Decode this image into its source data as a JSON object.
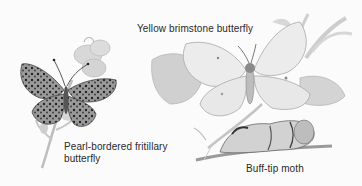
{
  "labels": {
    "brimstone": "Yellow brimstone butterfly",
    "fritillary_line1": "Pearl-bordered fritillary",
    "fritillary_line2": "butterfly",
    "moth": "Buff-tip moth"
  },
  "colors": {
    "background": "#fbfbfb",
    "text": "#2a2a2a"
  }
}
